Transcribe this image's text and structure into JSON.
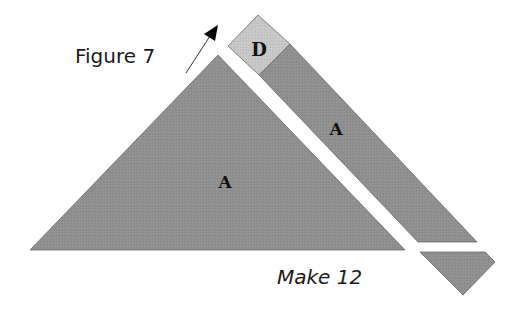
{
  "figure": {
    "title": "Figure 7",
    "caption": "Make 12"
  },
  "pieces": {
    "large_triangle": {
      "label": "A"
    },
    "strip": {
      "label": "A"
    },
    "corner_square": {
      "label": "D"
    },
    "trim_triangle": {
      "label": ""
    }
  },
  "colors": {
    "piece_a": "#8f8f8f",
    "piece_d": "#c6c6c6",
    "outline": "#6a6a6a",
    "text": "#111111",
    "background": "#ffffff"
  },
  "icons": {
    "direction_arrow": "arrow-up-right"
  }
}
